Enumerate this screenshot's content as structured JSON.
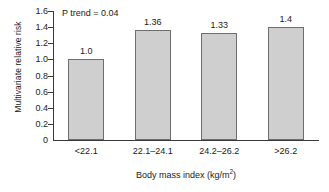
{
  "chart_data": {
    "type": "bar",
    "title": "",
    "subtitle": "",
    "categories": [
      "<22.1",
      "22.1–24.1",
      "24.2–26.2",
      ">26.2"
    ],
    "values": [
      1.0,
      1.36,
      1.33,
      1.4
    ],
    "value_labels": [
      "1.0",
      "1.36",
      "1.33",
      "1.4"
    ],
    "xlabel_text": "Body mass index (kg/m",
    "xlabel_superscript": "2",
    "xlabel_suffix": ")",
    "xlabel_full": "Body mass index (kg/m2)",
    "ylabel": "Multivariate relative risk",
    "ylim": [
      0,
      1.6
    ],
    "ytick_labels": [
      "1.6",
      "1.4",
      "1.2",
      "1.0",
      "0.8",
      "0.6",
      "0.4",
      "0.2",
      "0"
    ],
    "ytick_values": [
      1.6,
      1.4,
      1.2,
      1.0,
      0.8,
      0.6,
      0.4,
      0.2,
      0
    ],
    "grid": false,
    "legend": false,
    "legend_position": "none",
    "annotations": [
      {
        "text": "P trend = 0.04",
        "position": "top-left-inside-plot"
      }
    ],
    "bar_fill_color": "#cfcfcf",
    "bar_border_color": "#6e6e6e",
    "axis_color": "#3a3a3a",
    "text_color": "#1a1a1a",
    "background_color": "#ffffff"
  }
}
